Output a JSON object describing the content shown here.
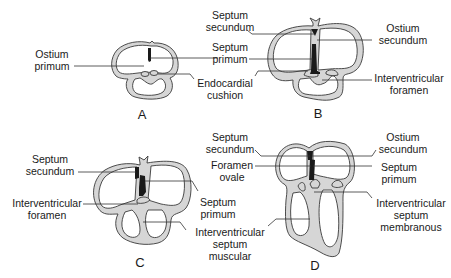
{
  "figure": {
    "panels": [
      {
        "id": "A",
        "label": "A",
        "annotations": [
          "Ostium primum",
          "Septum primum",
          "Endocardial cushion"
        ]
      },
      {
        "id": "B",
        "label": "B",
        "annotations": [
          "Septum secundum",
          "Septum primum",
          "Endocardial cushion",
          "Ostium secundum",
          "Interventricular foramen"
        ]
      },
      {
        "id": "C",
        "label": "C",
        "annotations": [
          "Septum secundum",
          "Interventricular foramen",
          "Septum primum",
          "Interventricular septum muscular"
        ]
      },
      {
        "id": "D",
        "label": "D",
        "annotations": [
          "Septum secundum",
          "Foramen ovale",
          "Ostium secundum",
          "Septum primum",
          "Interventricular septum membranous"
        ]
      }
    ]
  },
  "labels": {
    "a_ostium_primum": [
      "Ostium",
      "primum"
    ],
    "b_septum_secundum": [
      "Septum",
      "secundum"
    ],
    "b_septum_primum": [
      "Septum",
      "primum"
    ],
    "b_endocardial_cushion": [
      "Endocardial",
      "cushion"
    ],
    "b_ostium_secundum": [
      "Ostium",
      "secundum"
    ],
    "b_interventricular_foramen": [
      "Interventricular",
      "foramen"
    ],
    "c_septum_secundum": [
      "Septum",
      "secundum"
    ],
    "c_interventricular_foramen": [
      "Interventricular",
      "foramen"
    ],
    "c_septum_primum": [
      "Septum",
      "primum"
    ],
    "c_interventricular_septum_muscular": [
      "Interventricular",
      "septum",
      "muscular"
    ],
    "d_septum_secundum": [
      "Septum",
      "secundum"
    ],
    "d_foramen_ovale": [
      "Foramen",
      "ovale"
    ],
    "d_ostium_secundum": [
      "Ostium",
      "secundum"
    ],
    "d_septum_primum": [
      "Septum",
      "primum"
    ],
    "d_interventricular_septum_membranous": [
      "Interventricular",
      "septum",
      "membranous"
    ]
  },
  "colors": {
    "wall_fill": "#d6d6d6",
    "outline": "#3a3a3a",
    "septum": "#1a1a1a",
    "background": "#ffffff"
  }
}
